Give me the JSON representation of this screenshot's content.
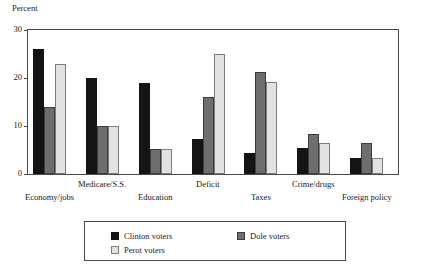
{
  "chart_data": {
    "type": "bar",
    "title": "",
    "subtitle": "",
    "xlabel": "",
    "ylabel": "Percent",
    "ylim": [
      0,
      30
    ],
    "yticks": [
      0,
      10,
      20,
      30
    ],
    "grid": false,
    "legend_position": "bottom",
    "orientation": "vertical",
    "grouping": "grouped",
    "categories": [
      "Economy/jobs",
      "Medicare/S.S.",
      "Education",
      "Deficit",
      "Taxes",
      "Crime/drugs",
      "Foreign policy"
    ],
    "series": [
      {
        "name": "Clinton voters",
        "color": "#141414",
        "values": [
          26,
          20,
          19,
          7.2,
          4.3,
          5.4,
          3.4
        ]
      },
      {
        "name": "Dole voters",
        "color": "#6e6e6e",
        "values": [
          14,
          10,
          5.2,
          16,
          21.2,
          8.4,
          6.4
        ]
      },
      {
        "name": "Perot voters",
        "color": "#e2e2e2",
        "values": [
          23,
          10,
          5.2,
          25,
          19.2,
          6.4,
          3.4
        ]
      }
    ]
  },
  "axis": {
    "y_title": "Percent",
    "tick_labels": [
      "0",
      "10",
      "20",
      "30"
    ]
  },
  "legend": {
    "entries": [
      {
        "label": "Clinton voters"
      },
      {
        "label": "Dole voters"
      },
      {
        "label": "Perot voters"
      }
    ]
  }
}
